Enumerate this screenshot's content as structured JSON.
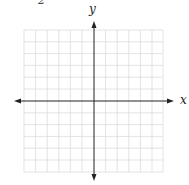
{
  "problem_number": "2",
  "axes": {
    "x_label": "x",
    "y_label": "y"
  },
  "grid": {
    "columns": 12,
    "rows": 12,
    "cell_px": 11.6,
    "line_color": "#d9d9d9",
    "axis_color": "#222222"
  }
}
